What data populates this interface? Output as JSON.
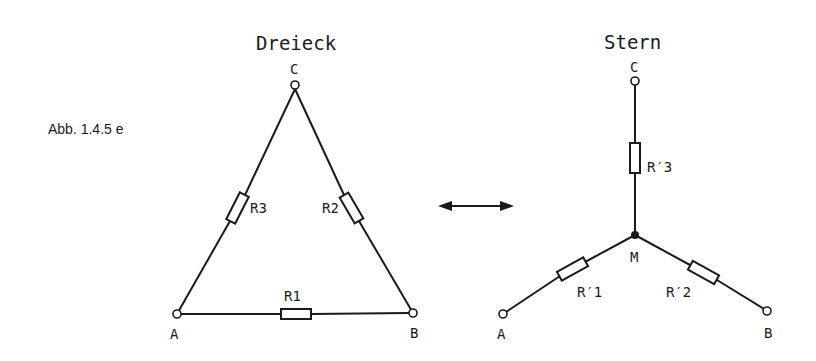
{
  "caption": "Abb. 1.4.5 e",
  "delta": {
    "title": "Dreieck",
    "nodes": {
      "A": "A",
      "B": "B",
      "C": "C"
    },
    "resistors": {
      "r1": "R1",
      "r2": "R2",
      "r3": "R3"
    }
  },
  "star": {
    "title": "Stern",
    "nodes": {
      "A": "A",
      "B": "B",
      "C": "C",
      "M": "M"
    },
    "resistors": {
      "r1": "R′1",
      "r2": "R′2",
      "r3": "R′3"
    }
  },
  "conversion_arrow": "bidirectional",
  "colors": {
    "line": "#1a1a1a",
    "background": "#ffffff"
  }
}
